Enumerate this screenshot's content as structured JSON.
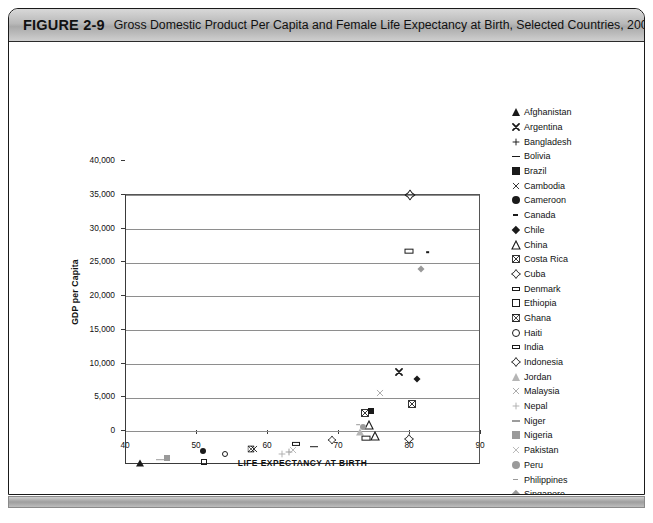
{
  "figure": {
    "number": "FIGURE 2-9",
    "title": "Gross Domestic Product Per Capita and Female Life Expectancy at Birth, Selected Countries, 2004"
  },
  "chart_data": {
    "type": "scatter",
    "title": "Gross Domestic Product Per Capita and Female Life Expectancy at Birth, Selected Countries, 2004",
    "xlabel": "LIFE EXPECTANCY AT BIRTH",
    "ylabel": "GDP per Capita",
    "xlim": [
      40,
      90
    ],
    "ylim": [
      0,
      40000
    ],
    "xticks": [
      40,
      50,
      60,
      70,
      80,
      90
    ],
    "xtick_labels": [
      "40",
      "50",
      "60",
      "70",
      "80",
      "90"
    ],
    "yticks": [
      0,
      5000,
      10000,
      15000,
      20000,
      25000,
      30000,
      35000,
      40000
    ],
    "ytick_labels": [
      "0",
      "5,000",
      "10,000",
      "15,000",
      "20,000",
      "25,000",
      "30,000",
      "35,000",
      "40,000"
    ],
    "grid": "horizontal",
    "legend_position": "right",
    "points": [
      {
        "name": "Afghanistan",
        "marker": "triangle-up-filled",
        "color": "#1a1a1a",
        "size": 7,
        "x": 42.0,
        "y": 300
      },
      {
        "name": "Argentina",
        "marker": "x-bold",
        "color": "#1a1a1a",
        "size": 8,
        "x": 78.5,
        "y": 13800
      },
      {
        "name": "Bangladesh",
        "marker": "plus",
        "color": "#9a9a9a",
        "size": 8,
        "x": 63.0,
        "y": 1900
      },
      {
        "name": "Bolivia",
        "marker": "dash",
        "color": "#1a1a1a",
        "size": 8,
        "x": 66.5,
        "y": 2700
      },
      {
        "name": "Brazil",
        "marker": "square-filled",
        "color": "#1a1a1a",
        "size": 6,
        "x": 74.5,
        "y": 8000
      },
      {
        "name": "Cambodia",
        "marker": "x-thin",
        "color": "#1a1a1a",
        "size": 8,
        "x": 58.0,
        "y": 2400
      },
      {
        "name": "Cameroon",
        "marker": "circle-filled",
        "color": "#1a1a1a",
        "size": 6,
        "x": 50.8,
        "y": 2100
      },
      {
        "name": "Canada",
        "marker": "dash-small",
        "color": "#1a1a1a",
        "size": 6,
        "x": 82.5,
        "y": 31500
      },
      {
        "name": "Chile",
        "marker": "diamond-filled",
        "color": "#1a1a1a",
        "size": 7,
        "x": 81.0,
        "y": 12700
      },
      {
        "name": "China",
        "marker": "triangle-up-open",
        "color": "#1a1a1a",
        "size": 8,
        "x": 74.2,
        "y": 5900
      },
      {
        "name": "Costa Rica",
        "marker": "square-crossed",
        "color": "#1a1a1a",
        "size": 8,
        "x": 80.3,
        "y": 9000
      },
      {
        "name": "Cuba",
        "marker": "diamond-open-plus",
        "color": "#1a1a1a",
        "size": 8,
        "x": 79.8,
        "y": 3900
      },
      {
        "name": "Denmark",
        "marker": "rect-open-wide",
        "color": "#1a1a1a",
        "size": 9,
        "x": 79.8,
        "y": 31700
      },
      {
        "name": "Ethiopia",
        "marker": "square-open",
        "color": "#1a1a1a",
        "size": 6,
        "x": 51.0,
        "y": 400
      },
      {
        "name": "Ghana",
        "marker": "square-bowtie",
        "color": "#1a1a1a",
        "size": 7,
        "x": 57.6,
        "y": 2300
      },
      {
        "name": "Haiti",
        "marker": "circle-open",
        "color": "#1a1a1a",
        "size": 6,
        "x": 54.0,
        "y": 1600
      },
      {
        "name": "India",
        "marker": "rect-open-wide",
        "color": "#1a1a1a",
        "size": 8,
        "x": 64.0,
        "y": 3100
      },
      {
        "name": "Indonesia",
        "marker": "diamond-open-plus",
        "color": "#1a1a1a",
        "size": 7,
        "x": 69.0,
        "y": 3700
      },
      {
        "name": "Jordan",
        "marker": "triangle-up-filled",
        "color": "#b5b5b5",
        "size": 7,
        "x": 73.0,
        "y": 4900
      },
      {
        "name": "Malaysia",
        "marker": "x-thin",
        "color": "#a0a0a0",
        "size": 8,
        "x": 75.8,
        "y": 10600
      },
      {
        "name": "Nepal",
        "marker": "plus",
        "color": "#b0b0b0",
        "size": 8,
        "x": 62.0,
        "y": 1600
      },
      {
        "name": "Niger",
        "marker": "dash",
        "color": "#9c9c9c",
        "size": 8,
        "x": 44.8,
        "y": 800
      },
      {
        "name": "Nigeria",
        "marker": "square-filled",
        "color": "#9a9a9a",
        "size": 6,
        "x": 45.8,
        "y": 1100
      },
      {
        "name": "Pakistan",
        "marker": "x-thin",
        "color": "#b0b0b0",
        "size": 8,
        "x": 63.5,
        "y": 2200
      },
      {
        "name": "Peru",
        "marker": "circle-filled",
        "color": "#9a9a9a",
        "size": 6,
        "x": 73.4,
        "y": 5700
      },
      {
        "name": "Philippines",
        "marker": "dash-small",
        "color": "#9a9a9a",
        "size": 6,
        "x": 72.7,
        "y": 6000
      },
      {
        "name": "Singapore",
        "marker": "diamond-filled",
        "color": "#9a9a9a",
        "size": 7,
        "x": 81.5,
        "y": 29000
      },
      {
        "name": "Sri Lanka",
        "marker": "triangle-up-open",
        "color": "#1a1a1a",
        "size": 8,
        "x": 75.0,
        "y": 4300
      },
      {
        "name": "Turkey",
        "marker": "square-crossed",
        "color": "#1a1a1a",
        "size": 8,
        "x": 73.6,
        "y": 7700
      },
      {
        "name": "United States of America",
        "marker": "diamond-open-plus",
        "color": "#1a1a1a",
        "size": 9,
        "x": 80.0,
        "y": 40000
      },
      {
        "name": "Vietnam",
        "marker": "rect-open-wide",
        "color": "#1a1a1a",
        "size": 9,
        "x": 73.8,
        "y": 4000
      }
    ]
  },
  "legend": {
    "items": [
      {
        "label": "Afghanistan",
        "marker": "triangle-up-filled",
        "color": "#1a1a1a"
      },
      {
        "label": "Argentina",
        "marker": "x-bold",
        "color": "#1a1a1a"
      },
      {
        "label": "Bangladesh",
        "marker": "plus",
        "color": "#1a1a1a"
      },
      {
        "label": "Bolivia",
        "marker": "dash",
        "color": "#1a1a1a"
      },
      {
        "label": "Brazil",
        "marker": "square-filled",
        "color": "#1a1a1a"
      },
      {
        "label": "Cambodia",
        "marker": "x-thin",
        "color": "#1a1a1a"
      },
      {
        "label": "Cameroon",
        "marker": "circle-filled",
        "color": "#1a1a1a"
      },
      {
        "label": "Canada",
        "marker": "dash-small",
        "color": "#1a1a1a"
      },
      {
        "label": "Chile",
        "marker": "diamond-filled",
        "color": "#1a1a1a"
      },
      {
        "label": "China",
        "marker": "triangle-up-open",
        "color": "#1a1a1a"
      },
      {
        "label": "Costa Rica",
        "marker": "square-crossed",
        "color": "#1a1a1a"
      },
      {
        "label": "Cuba",
        "marker": "diamond-open-plus",
        "color": "#1a1a1a"
      },
      {
        "label": "Denmark",
        "marker": "rect-open-wide",
        "color": "#1a1a1a"
      },
      {
        "label": "Ethiopia",
        "marker": "square-open",
        "color": "#1a1a1a"
      },
      {
        "label": "Ghana",
        "marker": "square-bowtie",
        "color": "#1a1a1a"
      },
      {
        "label": "Haiti",
        "marker": "circle-open",
        "color": "#1a1a1a"
      },
      {
        "label": "India",
        "marker": "rect-open-wide",
        "color": "#1a1a1a"
      },
      {
        "label": "Indonesia",
        "marker": "diamond-open-plus",
        "color": "#1a1a1a"
      },
      {
        "label": "Jordan",
        "marker": "triangle-up-filled",
        "color": "#b5b5b5"
      },
      {
        "label": "Malaysia",
        "marker": "x-thin",
        "color": "#a0a0a0"
      },
      {
        "label": "Nepal",
        "marker": "plus",
        "color": "#b0b0b0"
      },
      {
        "label": "Niger",
        "marker": "dash",
        "color": "#9c9c9c"
      },
      {
        "label": "Nigeria",
        "marker": "square-filled",
        "color": "#9a9a9a"
      },
      {
        "label": "Pakistan",
        "marker": "x-thin",
        "color": "#b0b0b0"
      },
      {
        "label": "Peru",
        "marker": "circle-filled",
        "color": "#9a9a9a"
      },
      {
        "label": "Philippines",
        "marker": "dash-small",
        "color": "#9a9a9a"
      },
      {
        "label": "Singapore",
        "marker": "diamond-filled",
        "color": "#9a9a9a"
      },
      {
        "label": "Sri Lanka",
        "marker": "triangle-up-open",
        "color": "#1a1a1a"
      },
      {
        "label": "Turkey",
        "marker": "square-crossed",
        "color": "#1a1a1a"
      },
      {
        "label": "United States of America",
        "marker": "diamond-open-plus",
        "color": "#1a1a1a"
      },
      {
        "label": "Vietnam",
        "marker": "rect-open-wide",
        "color": "#1a1a1a"
      }
    ]
  }
}
